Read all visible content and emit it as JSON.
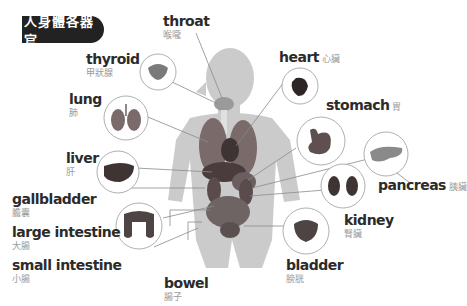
{
  "title": "人身體各器官",
  "colors": {
    "title_bg": "#222222",
    "title_text": "#ffffff",
    "label_en": "#2b2b2b",
    "label_zh": "#9a9a9a",
    "body_silhouette": "#c9c9c9",
    "leader_line": "#8a8a8a",
    "circle_stroke": "#9a9a9a"
  },
  "organs": [
    {
      "id": "throat",
      "en": "throat",
      "zh": "喉嚨"
    },
    {
      "id": "thyroid",
      "en": "thyroid",
      "zh": "甲狀腺"
    },
    {
      "id": "heart",
      "en": "heart",
      "zh": "心臟"
    },
    {
      "id": "lung",
      "en": "lung",
      "zh": "肺"
    },
    {
      "id": "stomach",
      "en": "stomach",
      "zh": "胃"
    },
    {
      "id": "liver",
      "en": "liver",
      "zh": "肝"
    },
    {
      "id": "pancreas",
      "en": "pancreas",
      "zh": "胰臟"
    },
    {
      "id": "gallbladder",
      "en": "gallbladder",
      "zh": "膽囊"
    },
    {
      "id": "kidney",
      "en": "kidney",
      "zh": "腎臟"
    },
    {
      "id": "large_intestine",
      "en": "large intestine",
      "zh": "大腸"
    },
    {
      "id": "small_intestine",
      "en": "small intestine",
      "zh": "小腸"
    },
    {
      "id": "bladder",
      "en": "bladder",
      "zh": "膀胱"
    },
    {
      "id": "bowel",
      "en": "bowel",
      "zh": "腸子"
    }
  ]
}
